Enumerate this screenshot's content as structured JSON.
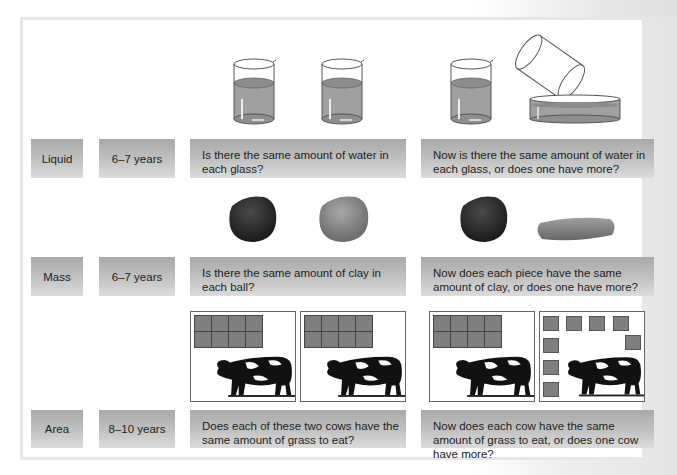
{
  "rows": [
    {
      "category": "Liquid",
      "age": "6–7 years",
      "question_before": "Is there the same amount of water in each glass?",
      "question_after": "Now is there the same amount of water in each glass, or does one have more?",
      "illustrations_before": [
        "beaker",
        "beaker"
      ],
      "illustrations_after": [
        "beaker",
        "tilted-beaker-pouring-into-dish"
      ]
    },
    {
      "category": "Mass",
      "age": "6–7 years",
      "question_before": "Is there the same amount of clay in each ball?",
      "question_after": "Now does each piece have the same amount of clay, or does one have more?",
      "illustrations_before": [
        "dark-clay-ball",
        "light-clay-ball"
      ],
      "illustrations_after": [
        "dark-clay-ball",
        "flattened-clay-sausage"
      ]
    },
    {
      "category": "Area",
      "age": "8–10 years",
      "question_before": "Does each of these two cows have the same amount of grass to eat?",
      "question_after": "Now does each cow have the same amount of grass to eat, or does one cow have more?",
      "illustrations_before": [
        "cow-with-grouped-grass-8",
        "cow-with-grouped-grass-8"
      ],
      "illustrations_after": [
        "cow-with-grouped-grass-8",
        "cow-with-scattered-grass-8"
      ]
    }
  ],
  "colors": {
    "label_box_top": "#a9a9a9",
    "label_box_bottom": "#dcdcdc",
    "water": "#9a9a9a",
    "grass_square": "#7f7f7f",
    "clay_dark": "#2e2e2e",
    "clay_light": "#8a8a8a"
  }
}
